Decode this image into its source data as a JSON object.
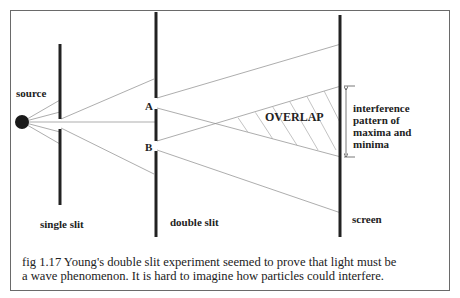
{
  "figure": {
    "labels": {
      "source": "source",
      "slit_a": "A",
      "slit_b": "B",
      "overlap": "OVERLAP",
      "interference": [
        "interference",
        "pattern of",
        "maxima and",
        "minima"
      ],
      "single_slit": "single slit",
      "double_slit": "double slit",
      "screen": "screen"
    },
    "caption": {
      "line1": "fig 1.17  Young's double slit experiment seemed to prove that light must be",
      "line2": "a wave phenomenon. It is hard to imagine how particles could interfere."
    },
    "colors": {
      "ink": "#222222",
      "rays": "#8a8a8a",
      "frame": "#6a6a6a"
    }
  }
}
